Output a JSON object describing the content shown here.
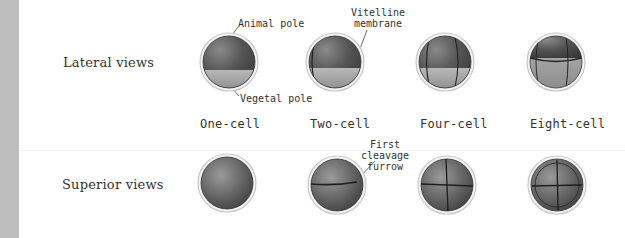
{
  "figure": {
    "row_labels": {
      "lateral": "Lateral views",
      "superior": "Superior views"
    },
    "stage_labels": [
      "One-cell",
      "Two-cell",
      "Four-cell",
      "Eight-cell"
    ],
    "annotations": {
      "animal_pole": "Animal pole",
      "vegetal_pole": "Vegetal pole",
      "vitelline_line1": "Vitelline",
      "vitelline_line2": "membrane",
      "furrow_line1": "First cleavage",
      "furrow_line2": "furrow"
    },
    "colors": {
      "strip": "#bdbdbd",
      "animal_hemisphere": "#5a5a5a",
      "vegetal_hemisphere": "#a8a8a8",
      "membrane": "#d8d8d8",
      "furrow": "#2a2a2a"
    }
  }
}
